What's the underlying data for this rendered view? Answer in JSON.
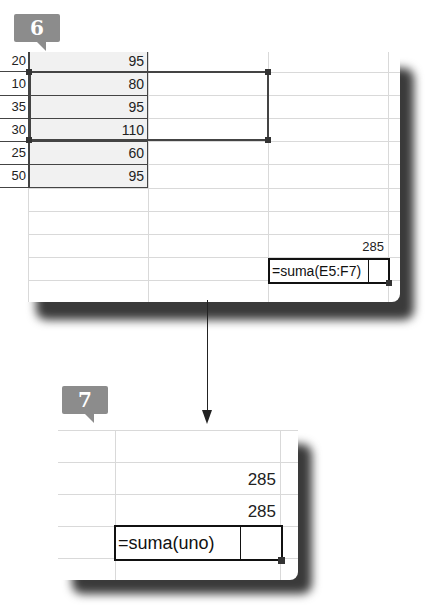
{
  "steps": [
    {
      "number": "6"
    },
    {
      "number": "7"
    }
  ],
  "top_panel": {
    "row_headers": [
      "20",
      "10",
      "35",
      "30",
      "25",
      "50"
    ],
    "values": [
      "95",
      "80",
      "95",
      "110",
      "60",
      "95"
    ],
    "sum_result": "285",
    "formula_input": "=suma(E5:F7)"
  },
  "bottom_panel": {
    "results": [
      "285",
      "285"
    ],
    "formula_input": "=suma(uno)"
  },
  "colors": {
    "badge": "#8c8c8c",
    "shaded_cells": "#f1f1f1",
    "gridline": "#d9d9d9",
    "border": "#444444"
  }
}
